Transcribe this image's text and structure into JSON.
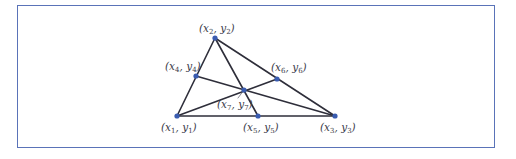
{
  "figure": {
    "frame_color": "#5a73b8",
    "line_color": "#2e2e3a",
    "point_color": "#3a5cb0",
    "points": [
      {
        "id": "p1",
        "label": "(x1, y1)",
        "var_x": "x",
        "sub_x": "1",
        "var_y": "y",
        "sub_y": "1",
        "x": 177,
        "y": 116
      },
      {
        "id": "p2",
        "label": "(x2, y2)",
        "var_x": "x",
        "sub_x": "2",
        "var_y": "y",
        "sub_y": "2",
        "x": 215,
        "y": 38
      },
      {
        "id": "p3",
        "label": "(x3, y3)",
        "var_x": "x",
        "sub_x": "3",
        "var_y": "y",
        "sub_y": "3",
        "x": 335,
        "y": 116
      },
      {
        "id": "p4",
        "label": "(x4, y4)",
        "var_x": "x",
        "sub_x": "4",
        "var_y": "y",
        "sub_y": "4",
        "x": 196,
        "y": 76
      },
      {
        "id": "p5",
        "label": "(x5, y5)",
        "var_x": "x",
        "sub_x": "5",
        "var_y": "y",
        "sub_y": "5",
        "x": 258,
        "y": 116
      },
      {
        "id": "p6",
        "label": "(x6, y6)",
        "var_x": "x",
        "sub_x": "6",
        "var_y": "y",
        "sub_y": "6",
        "x": 277,
        "y": 79
      },
      {
        "id": "p7",
        "label": "(x7, y7)",
        "var_x": "x",
        "sub_x": "7",
        "var_y": "y",
        "sub_y": "7",
        "x": 244,
        "y": 90
      }
    ],
    "edges": [
      [
        "p1",
        "p2"
      ],
      [
        "p2",
        "p3"
      ],
      [
        "p1",
        "p3"
      ],
      [
        "p2",
        "p5"
      ],
      [
        "p1",
        "p6"
      ],
      [
        "p3",
        "p4"
      ]
    ],
    "labels": {
      "p1": {
        "open": "(",
        "x": "x",
        "xs": "1",
        "sep": ", ",
        "y": "y",
        "ys": "1",
        "close": ")"
      },
      "p2": {
        "open": "(",
        "x": "x",
        "xs": "2",
        "sep": ", ",
        "y": "y",
        "ys": "2",
        "close": ")"
      },
      "p3": {
        "open": "(",
        "x": "x",
        "xs": "3",
        "sep": ", ",
        "y": "y",
        "ys": "3",
        "close": ")"
      },
      "p4": {
        "open": "(",
        "x": "x",
        "xs": "4",
        "sep": ", ",
        "y": "y",
        "ys": "4",
        "close": ")"
      },
      "p5": {
        "open": "(",
        "x": "x",
        "xs": "5",
        "sep": ", ",
        "y": "y",
        "ys": "5",
        "close": ")"
      },
      "p6": {
        "open": "(",
        "x": "x",
        "xs": "6",
        "sep": ", ",
        "y": "y",
        "ys": "6",
        "close": ")"
      },
      "p7": {
        "open": "(",
        "x": "x",
        "xs": "7",
        "sep": ", ",
        "y": "y",
        "ys": "7",
        "close": ")"
      }
    }
  }
}
